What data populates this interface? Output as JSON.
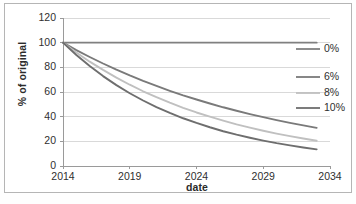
{
  "chart_data": {
    "type": "line",
    "title": "",
    "xlabel": "date",
    "ylabel": "% of original",
    "xlim": [
      2014,
      2034
    ],
    "ylim": [
      0,
      120
    ],
    "xticks": [
      2014,
      2019,
      2024,
      2029,
      2034
    ],
    "yticks": [
      0,
      20,
      40,
      60,
      80,
      100,
      120
    ],
    "grid": "horizontal",
    "legend_position": "right",
    "x": [
      2014,
      2015,
      2016,
      2017,
      2018,
      2019,
      2020,
      2021,
      2022,
      2023,
      2024,
      2025,
      2026,
      2027,
      2028,
      2029,
      2030,
      2031,
      2032,
      2033
    ],
    "series": [
      {
        "name": "0%",
        "color": "#808080",
        "values": [
          100,
          100,
          100,
          100,
          100,
          100,
          100,
          100,
          100,
          100,
          100,
          100,
          100,
          100,
          100,
          100,
          100,
          100,
          100,
          100
        ]
      },
      {
        "name": "6%",
        "color": "#7a7a7a",
        "values": [
          100,
          94,
          88.4,
          83.1,
          78.1,
          73.4,
          69.0,
          64.9,
          61.0,
          57.3,
          53.9,
          50.7,
          47.6,
          44.8,
          42.1,
          39.6,
          37.2,
          35.0,
          32.9,
          30.9
        ]
      },
      {
        "name": "8%",
        "color": "#c0c0c0",
        "values": [
          100,
          92,
          84.6,
          77.9,
          71.6,
          65.9,
          60.6,
          55.8,
          51.3,
          47.2,
          43.4,
          40.0,
          36.8,
          33.8,
          31.1,
          28.6,
          26.3,
          24.2,
          22.3,
          20.5
        ]
      },
      {
        "name": "10%",
        "color": "#6e6e6e",
        "values": [
          100,
          90,
          81,
          72.9,
          65.6,
          59.0,
          53.1,
          47.8,
          43.0,
          38.7,
          34.9,
          31.4,
          28.2,
          25.4,
          22.9,
          20.6,
          18.5,
          16.7,
          15.0,
          13.5
        ]
      }
    ]
  },
  "axes": {
    "y_title": "% of original",
    "x_title": "date",
    "y_tick_labels": [
      "120",
      "100",
      "80",
      "60",
      "40",
      "20",
      "0"
    ],
    "x_tick_labels": [
      "2014",
      "2019",
      "2024",
      "2029",
      "2034"
    ]
  },
  "legend": {
    "items": [
      {
        "label": "0%"
      },
      {
        "label": "6%"
      },
      {
        "label": "8%"
      },
      {
        "label": "10%"
      }
    ]
  },
  "caption": ""
}
